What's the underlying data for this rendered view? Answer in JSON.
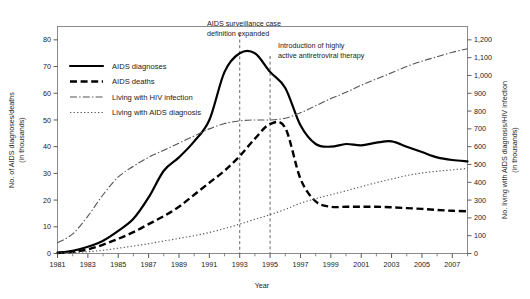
{
  "chart_data": {
    "type": "line",
    "title": "",
    "xlabel": "Year",
    "ylabel": "No. of AIDS diagnoses/deaths (in thousands)",
    "y2label": "No. living with AIDS diagnosis/HIV infection (in thousands)",
    "grid": false,
    "legend_position": "upper-left-inside",
    "xlim": [
      1981,
      2008
    ],
    "ylim": [
      0,
      85
    ],
    "y2lim": [
      0,
      1275
    ],
    "x_ticks": [
      1981,
      1983,
      1985,
      1987,
      1989,
      1991,
      1993,
      1995,
      1997,
      1999,
      2001,
      2003,
      2005,
      2007
    ],
    "x_tick_labels": [
      "1981",
      "1983",
      "1985",
      "1987",
      "1989",
      "1991",
      "1993",
      "1995",
      "1997",
      "1999",
      "2001",
      "2003",
      "2005",
      "2007"
    ],
    "x_minor_ticks": [
      1982,
      1984,
      1986,
      1988,
      1990,
      1992,
      1994,
      1996,
      1998,
      2000,
      2002,
      2004,
      2006,
      2008
    ],
    "y_ticks": [
      0,
      10,
      20,
      30,
      40,
      50,
      60,
      70,
      80
    ],
    "y_tick_labels": [
      "0",
      "10",
      "20",
      "30",
      "40",
      "50",
      "60",
      "70",
      "80"
    ],
    "y2_ticks": [
      0,
      100,
      200,
      300,
      400,
      500,
      600,
      700,
      800,
      900,
      1000,
      1100,
      1200
    ],
    "y2_tick_labels": [
      "0",
      "100",
      "200",
      "300",
      "400",
      "500",
      "600",
      "700",
      "800",
      "900",
      "1,000",
      "1,100",
      "1,200"
    ],
    "x": [
      1981,
      1982,
      1983,
      1984,
      1985,
      1986,
      1987,
      1988,
      1989,
      1990,
      1991,
      1992,
      1993,
      1994,
      1995,
      1996,
      1997,
      1998,
      1999,
      2000,
      2001,
      2002,
      2003,
      2004,
      2005,
      2006,
      2007,
      2008
    ],
    "series": [
      {
        "name": "AIDS diagnoses",
        "axis": "left",
        "style": "solid",
        "units": "thousands",
        "values": [
          0.3,
          1.0,
          2.5,
          4.8,
          8.5,
          13.0,
          21.0,
          31.0,
          36.0,
          42.0,
          50.0,
          68.0,
          75.0,
          75.0,
          68.0,
          62.0,
          48.0,
          41.0,
          40.0,
          41.0,
          40.5,
          41.5,
          42.0,
          40.0,
          38.0,
          36.0,
          35.0,
          34.5
        ]
      },
      {
        "name": "AIDS deaths",
        "axis": "left",
        "style": "dashed",
        "units": "thousands",
        "values": [
          0.2,
          0.6,
          1.5,
          3.3,
          5.5,
          8.0,
          11.0,
          14.0,
          17.5,
          22.0,
          26.5,
          31.0,
          36.5,
          43.0,
          48.5,
          47.0,
          28.0,
          19.5,
          17.5,
          17.5,
          17.5,
          17.5,
          17.3,
          17.0,
          16.7,
          16.3,
          16.0,
          15.8
        ]
      },
      {
        "name": "Living with HIV infection",
        "axis": "right",
        "style": "dash-dot",
        "units": "thousands",
        "values": [
          60,
          110,
          210,
          330,
          430,
          490,
          540,
          580,
          620,
          660,
          700,
          730,
          745,
          750,
          750,
          760,
          790,
          830,
          870,
          905,
          945,
          980,
          1015,
          1050,
          1080,
          1105,
          1130,
          1150
        ]
      },
      {
        "name": "Living with AIDS diagnosis",
        "axis": "right",
        "style": "dotted",
        "units": "thousands",
        "values": [
          2,
          5,
          10,
          18,
          30,
          42,
          55,
          70,
          85,
          100,
          118,
          140,
          165,
          192,
          218,
          248,
          282,
          308,
          330,
          352,
          375,
          398,
          418,
          438,
          452,
          462,
          470,
          478
        ]
      }
    ],
    "annotations": [
      {
        "id": "case-definition",
        "lines": [
          "AIDS surveillance case",
          "definition expanded"
        ],
        "x": 1993
      },
      {
        "id": "haart",
        "lines": [
          "Introduction of highly",
          "active antiretroviral therapy"
        ],
        "x": 1995
      }
    ],
    "colors": {
      "diagnoses": "#000000",
      "deaths": "#000000",
      "hiv": "#555555",
      "living_aids": "#555555",
      "frame": "#8a8a8a",
      "annotation_line": "#555555"
    }
  }
}
